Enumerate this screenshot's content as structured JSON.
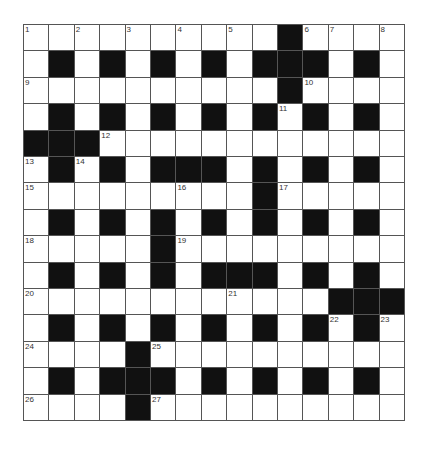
{
  "puzzle": {
    "rows": 15,
    "cols": 15,
    "colors": {
      "black": "#111111",
      "white": "#ffffff",
      "line": "#555555"
    },
    "grid": [
      [
        "1",
        ".",
        "2",
        ".",
        "3",
        ".",
        "4",
        ".",
        "5",
        ".",
        "#",
        "6",
        "7",
        ".",
        "8"
      ],
      [
        ".",
        "#",
        ".",
        "#",
        ".",
        "#",
        ".",
        "#",
        ".",
        "#",
        "#",
        "#",
        ".",
        "#",
        "."
      ],
      [
        "9",
        ".",
        ".",
        ".",
        ".",
        ".",
        ".",
        ".",
        ".",
        ".",
        "#",
        "10",
        ".",
        ".",
        "."
      ],
      [
        ".",
        "#",
        ".",
        "#",
        ".",
        "#",
        ".",
        "#",
        ".",
        "#",
        "11",
        "#",
        ".",
        "#",
        "."
      ],
      [
        "#",
        "#",
        "#",
        "12",
        ".",
        ".",
        ".",
        ".",
        ".",
        ".",
        ".",
        ".",
        ".",
        ".",
        "."
      ],
      [
        "13",
        "#",
        "14",
        "#",
        ".",
        "#",
        "#",
        "#",
        ".",
        "#",
        ".",
        "#",
        ".",
        "#",
        "."
      ],
      [
        "15",
        ".",
        ".",
        ".",
        ".",
        ".",
        "16",
        ".",
        ".",
        "#",
        "17",
        ".",
        ".",
        ".",
        "."
      ],
      [
        ".",
        "#",
        ".",
        "#",
        ".",
        "#",
        ".",
        "#",
        ".",
        "#",
        ".",
        "#",
        ".",
        "#",
        "."
      ],
      [
        "18",
        ".",
        ".",
        ".",
        ".",
        "#",
        "19",
        ".",
        ".",
        ".",
        ".",
        ".",
        ".",
        ".",
        "."
      ],
      [
        ".",
        "#",
        ".",
        "#",
        ".",
        "#",
        ".",
        "#",
        "#",
        "#",
        ".",
        "#",
        ".",
        "#",
        "."
      ],
      [
        "20",
        ".",
        ".",
        ".",
        ".",
        ".",
        ".",
        ".",
        "21",
        ".",
        ".",
        ".",
        "#",
        "#",
        "#"
      ],
      [
        ".",
        "#",
        ".",
        "#",
        ".",
        "#",
        ".",
        "#",
        ".",
        "#",
        ".",
        "#",
        "22",
        "#",
        "23"
      ],
      [
        "24",
        ".",
        ".",
        ".",
        "#",
        "25",
        ".",
        ".",
        ".",
        ".",
        ".",
        ".",
        ".",
        ".",
        "."
      ],
      [
        ".",
        "#",
        ".",
        "#",
        "#",
        "#",
        ".",
        "#",
        ".",
        "#",
        ".",
        "#",
        ".",
        "#",
        "."
      ],
      [
        "26",
        ".",
        ".",
        ".",
        "#",
        "27",
        ".",
        ".",
        ".",
        ".",
        ".",
        ".",
        ".",
        ".",
        "."
      ]
    ]
  }
}
